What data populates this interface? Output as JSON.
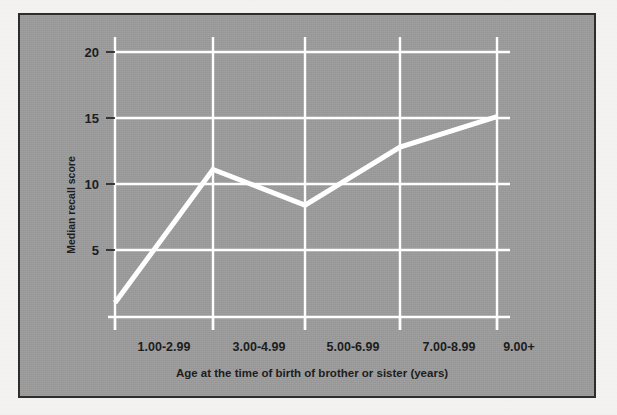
{
  "figure": {
    "background_color": "#f4f3f1",
    "plate_color": "#9b9b9b",
    "frame_color": "#2e2d2b",
    "line_color": "#ffffff",
    "grid_color": "#ffffff",
    "text_color": "#1d1d1d"
  },
  "chart_data": {
    "type": "line",
    "title": "",
    "subtitle": "",
    "xlabel": "Age at the time of birth of brother or sister (years)",
    "ylabel": "Median recall score",
    "categories": [
      "1.00-2.99",
      "3.00-4.99",
      "5.00-6.99",
      "7.00-8.99",
      "9.00+"
    ],
    "values": [
      1.0,
      11.1,
      8.4,
      12.8,
      15.1
    ],
    "series": [
      {
        "name": "Median recall score",
        "values": [
          1.0,
          11.1,
          8.4,
          12.8,
          15.1
        ]
      }
    ],
    "ylim": [
      0.9,
      21.2
    ],
    "yticks": [
      5,
      10,
      15,
      20
    ],
    "ytick_labels": [
      "5",
      "10",
      "15",
      "20"
    ],
    "xtick_labels": [
      "1.00-2.99",
      "3.00-4.99",
      "5.00-6.99",
      "7.00-8.99",
      "9.00+"
    ],
    "grid": true,
    "grid_orientation": "both",
    "legend": false,
    "legend_position": "none",
    "markers": false,
    "line_width_px": 5
  },
  "axes": {
    "y_tick_0": "5",
    "y_tick_1": "10",
    "y_tick_2": "15",
    "y_tick_3": "20",
    "y_title": "Median recall score",
    "x_title": "Age at the time of birth of brother or sister (years)",
    "x_cat_0": "1.00-2.99",
    "x_cat_1": "3.00-4.99",
    "x_cat_2": "5.00-6.99",
    "x_cat_3": "7.00-8.99",
    "x_cat_4": "9.00+"
  }
}
